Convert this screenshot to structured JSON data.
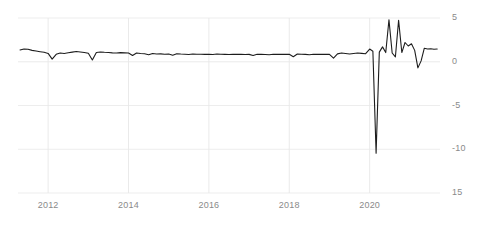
{
  "chart_data": {
    "type": "line",
    "title": "",
    "subtitle": "",
    "xlabel": "",
    "ylabel": "",
    "xlim": [
      2011.25,
      2021.75
    ],
    "ylim": [
      -15,
      5
    ],
    "grid": true,
    "grid_axes": "both",
    "legend": false,
    "legend_position": "none",
    "line_color": "#1d1d1d",
    "line_width": 1.1,
    "grid_color": "#e8e8e8",
    "axis_label_color": "#8a8a8a",
    "background_color": "#ffffff",
    "y_ticks": [
      5,
      0,
      -5,
      -10,
      -15
    ],
    "y_tick_labels": [
      "5",
      "0",
      "-5",
      "-10",
      "15"
    ],
    "y_axis_side": "right",
    "x_ticks": [
      2012,
      2014,
      2016,
      2018,
      2020
    ],
    "x_tick_labels": [
      "2012",
      "2014",
      "2016",
      "2018",
      "2020"
    ],
    "series": [
      {
        "name": "",
        "x": [
          2011.3,
          2011.4,
          2011.5,
          2011.6,
          2011.7,
          2011.8,
          2011.9,
          2012.0,
          2012.1,
          2012.2,
          2012.3,
          2012.4,
          2012.5,
          2012.6,
          2012.7,
          2012.8,
          2012.9,
          2013.0,
          2013.1,
          2013.2,
          2013.3,
          2013.4,
          2013.5,
          2013.6,
          2013.7,
          2013.8,
          2013.9,
          2014.0,
          2014.1,
          2014.2,
          2014.3,
          2014.4,
          2014.5,
          2014.6,
          2014.7,
          2014.8,
          2014.9,
          2015.0,
          2015.1,
          2015.2,
          2015.3,
          2015.4,
          2015.5,
          2015.6,
          2015.7,
          2015.8,
          2015.9,
          2016.0,
          2016.1,
          2016.2,
          2016.3,
          2016.4,
          2016.5,
          2016.6,
          2016.7,
          2016.8,
          2016.9,
          2017.0,
          2017.1,
          2017.2,
          2017.3,
          2017.4,
          2017.5,
          2017.6,
          2017.7,
          2017.8,
          2017.9,
          2018.0,
          2018.1,
          2018.2,
          2018.3,
          2018.4,
          2018.5,
          2018.6,
          2018.7,
          2018.8,
          2018.9,
          2019.0,
          2019.1,
          2019.2,
          2019.3,
          2019.4,
          2019.5,
          2019.6,
          2019.7,
          2019.8,
          2019.9,
          2020.0,
          2020.08,
          2020.16,
          2020.24,
          2020.32,
          2020.4,
          2020.48,
          2020.56,
          2020.64,
          2020.72,
          2020.8,
          2020.88,
          2020.96,
          2021.04,
          2021.12,
          2021.2,
          2021.28,
          2021.36,
          2021.44,
          2021.52,
          2021.6,
          2021.68
        ],
        "values": [
          1.35,
          1.45,
          1.42,
          1.3,
          1.22,
          1.15,
          1.08,
          0.95,
          0.3,
          0.85,
          1.0,
          0.95,
          1.02,
          1.1,
          1.18,
          1.12,
          1.05,
          0.98,
          0.2,
          1.05,
          1.12,
          1.08,
          1.05,
          1.02,
          1.0,
          1.04,
          1.02,
          1.0,
          0.72,
          1.0,
          0.95,
          0.92,
          0.8,
          0.95,
          0.88,
          0.9,
          0.86,
          0.88,
          0.74,
          0.92,
          0.88,
          0.85,
          0.82,
          0.88,
          0.85,
          0.86,
          0.84,
          0.85,
          0.82,
          0.88,
          0.86,
          0.84,
          0.82,
          0.86,
          0.84,
          0.85,
          0.83,
          0.84,
          0.72,
          0.86,
          0.84,
          0.82,
          0.8,
          0.86,
          0.84,
          0.85,
          0.84,
          0.85,
          0.58,
          0.88,
          0.86,
          0.84,
          0.8,
          0.86,
          0.84,
          0.86,
          0.84,
          0.85,
          0.42,
          0.9,
          1.0,
          0.95,
          0.88,
          0.95,
          1.0,
          0.96,
          0.92,
          1.45,
          1.2,
          -10.45,
          1.1,
          1.7,
          1.05,
          4.8,
          1.0,
          0.55,
          4.75,
          1.05,
          2.2,
          1.8,
          2.05,
          1.3,
          -0.7,
          0.1,
          1.55,
          1.45,
          1.48,
          1.42,
          1.45
        ]
      }
    ],
    "annotations": []
  },
  "axes": {
    "y_labels": [
      {
        "text": "5",
        "value": 5
      },
      {
        "text": "0",
        "value": 0
      },
      {
        "text": "-5",
        "value": -5
      },
      {
        "text": "-10",
        "value": -10
      },
      {
        "text": "15",
        "value": -15
      }
    ],
    "x_labels": [
      {
        "text": "2012",
        "value": 2012
      },
      {
        "text": "2014",
        "value": 2014
      },
      {
        "text": "2016",
        "value": 2016
      },
      {
        "text": "2018",
        "value": 2018
      },
      {
        "text": "2020",
        "value": 2020
      }
    ]
  }
}
